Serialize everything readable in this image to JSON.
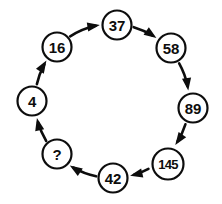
{
  "diagram": {
    "type": "cycle-diagram",
    "direction": "clockwise",
    "background_color": "#ffffff",
    "stroke_color": "#0d0d0d",
    "node_fill_color": "#ffffff",
    "center": {
      "x": 112,
      "y": 101
    },
    "radius": 77,
    "nodes": [
      {
        "id": "n37",
        "label": "37",
        "cx": 117,
        "cy": 25,
        "r": 14.5,
        "size": "size-normal"
      },
      {
        "id": "n58",
        "label": "58",
        "cx": 171,
        "cy": 48,
        "r": 14.5,
        "size": "size-normal"
      },
      {
        "id": "n89",
        "label": "89",
        "cx": 193,
        "cy": 108,
        "r": 14.5,
        "size": "size-normal"
      },
      {
        "id": "n145",
        "label": "145",
        "cx": 168,
        "cy": 164,
        "r": 15.5,
        "size": "size-small"
      },
      {
        "id": "n42",
        "label": "42",
        "cx": 113,
        "cy": 178,
        "r": 14.5,
        "size": "size-normal"
      },
      {
        "id": "nq",
        "label": "?",
        "cx": 57,
        "cy": 154,
        "r": 14.5,
        "size": "size-normal"
      },
      {
        "id": "n4",
        "label": "4",
        "cx": 32,
        "cy": 101,
        "r": 14.5,
        "size": "size-normal"
      },
      {
        "id": "n16",
        "label": "16",
        "cx": 57,
        "cy": 47,
        "r": 14.5,
        "size": "size-normal"
      }
    ],
    "edges": [
      {
        "id": "e-37-58",
        "from": "37",
        "to": "58"
      },
      {
        "id": "e-58-89",
        "from": "58",
        "to": "89"
      },
      {
        "id": "e-89-145",
        "from": "89",
        "to": "145"
      },
      {
        "id": "e-145-42",
        "from": "145",
        "to": "42"
      },
      {
        "id": "e-42-q",
        "from": "42",
        "to": "?"
      },
      {
        "id": "e-q-4",
        "from": "?",
        "to": "4"
      },
      {
        "id": "e-4-16",
        "from": "4",
        "to": "16"
      },
      {
        "id": "e-16-37",
        "from": "16",
        "to": "37"
      }
    ]
  },
  "chart_data": {
    "type": "diagram",
    "sequence": [
      "4",
      "16",
      "37",
      "58",
      "89",
      "145",
      "42",
      "?"
    ],
    "values": [
      4,
      16,
      37,
      58,
      89,
      145,
      42,
      null
    ],
    "unknown_index": 7,
    "flow": "clockwise"
  }
}
